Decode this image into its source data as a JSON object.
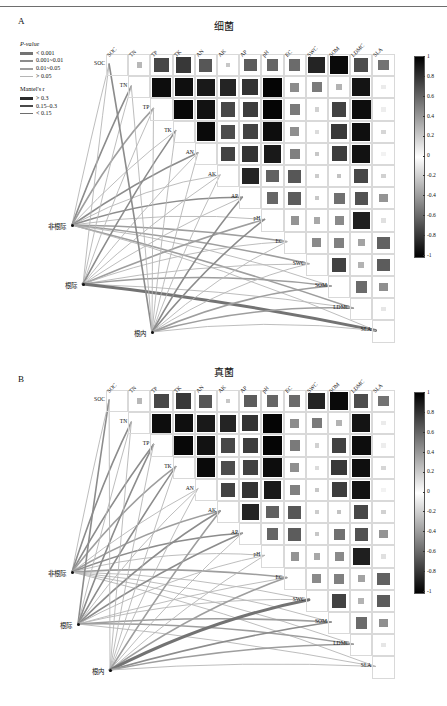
{
  "figure": {
    "panels": [
      {
        "letter": "A",
        "title": "细菌"
      },
      {
        "letter": "B",
        "title": "真菌"
      }
    ]
  },
  "legend": {
    "pvalue": {
      "title": "P-value",
      "items": [
        {
          "label": "< 0.001",
          "width": 3.0,
          "color": "#737373"
        },
        {
          "label": "0.001~0.01",
          "width": 2.2,
          "color": "#8c8c8c"
        },
        {
          "label": "0.01~0.05",
          "width": 2.2,
          "color": "#9e9e9e"
        },
        {
          "label": "> 0.05",
          "width": 1.4,
          "color": "#b5b5b5"
        }
      ]
    },
    "mantel": {
      "title": "Mantel's r",
      "items": [
        {
          "label": "> 0.3",
          "width": 3.0,
          "color": "#2b2b2b"
        },
        {
          "label": "0.15–0.3",
          "width": 1.6,
          "color": "#4a4a4a"
        },
        {
          "label": "< 0.15",
          "width": 0.9,
          "color": "#6e6e6e"
        }
      ]
    }
  },
  "colorbar": {
    "ticks": [
      "1",
      "0.8",
      "0.6",
      "0.4",
      "0.2",
      "0",
      "-0.2",
      "-0.4",
      "-0.6",
      "-0.8",
      "-1"
    ],
    "max": 1,
    "min": -1,
    "high_color": "#000000",
    "mid_color": "#ffffff",
    "low_color": "#000000"
  },
  "network": {
    "nodes": [
      {
        "id": "non_rhizosphere",
        "label": "非根际"
      },
      {
        "id": "rhizosphere",
        "label": "根际"
      },
      {
        "id": "endosphere",
        "label": "根内"
      }
    ]
  },
  "chart_data": {
    "type": "heatmap",
    "variables": [
      "SOC",
      "TN",
      "TP",
      "TK",
      "AN",
      "AK",
      "AP",
      "pH",
      "EC",
      "SWC",
      "SOM",
      "LDMC",
      "SLA"
    ],
    "xlabel": "",
    "ylabel": "",
    "zlim": [
      -1,
      1
    ],
    "legend_position": "right",
    "grid": true,
    "panels": [
      {
        "letter": "A",
        "title": "细菌",
        "matrix": [
          [
            1.0,
            0.28,
            0.72,
            0.78,
            0.66,
            0.22,
            0.64,
            0.6,
            0.58,
            0.86,
            0.96,
            0.7,
            0.55
          ],
          [
            null,
            1.0,
            0.95,
            0.94,
            0.9,
            0.86,
            0.8,
            0.98,
            0.45,
            0.52,
            0.3,
            0.92,
            0.08
          ],
          [
            null,
            null,
            1.0,
            0.97,
            0.93,
            0.72,
            0.76,
            0.98,
            0.52,
            0.18,
            0.74,
            0.95,
            0.07
          ],
          [
            null,
            null,
            null,
            1.0,
            0.96,
            0.7,
            0.74,
            0.95,
            0.44,
            0.14,
            0.78,
            0.94,
            0.16
          ],
          [
            null,
            null,
            null,
            null,
            1.0,
            0.74,
            0.8,
            0.9,
            0.5,
            0.22,
            0.76,
            0.93,
            0.05
          ],
          [
            null,
            null,
            null,
            null,
            null,
            1.0,
            0.86,
            0.62,
            0.66,
            0.2,
            0.24,
            0.72,
            0.18
          ],
          [
            null,
            null,
            null,
            null,
            null,
            null,
            1.0,
            0.6,
            0.64,
            0.22,
            0.56,
            0.68,
            0.42
          ],
          [
            null,
            null,
            null,
            null,
            null,
            null,
            null,
            1.0,
            0.42,
            0.34,
            0.46,
            0.88,
            0.12
          ],
          [
            null,
            null,
            null,
            null,
            null,
            null,
            null,
            null,
            1.0,
            0.46,
            0.5,
            0.36,
            0.62
          ],
          [
            null,
            null,
            null,
            null,
            null,
            null,
            null,
            null,
            null,
            1.0,
            0.74,
            0.3,
            0.64
          ],
          [
            null,
            null,
            null,
            null,
            null,
            null,
            null,
            null,
            null,
            null,
            1.0,
            0.58,
            0.44
          ],
          [
            null,
            null,
            null,
            null,
            null,
            null,
            null,
            null,
            null,
            null,
            null,
            1.0,
            0.1
          ],
          [
            null,
            null,
            null,
            null,
            null,
            null,
            null,
            null,
            null,
            null,
            null,
            null,
            1.0
          ]
        ]
      },
      {
        "letter": "B",
        "title": "真菌",
        "matrix": [
          [
            1.0,
            0.28,
            0.72,
            0.78,
            0.66,
            0.22,
            0.64,
            0.6,
            0.58,
            0.86,
            0.96,
            0.7,
            0.55
          ],
          [
            null,
            1.0,
            0.95,
            0.94,
            0.9,
            0.86,
            0.8,
            0.98,
            0.45,
            0.52,
            0.3,
            0.92,
            0.08
          ],
          [
            null,
            null,
            1.0,
            0.97,
            0.93,
            0.72,
            0.76,
            0.98,
            0.52,
            0.18,
            0.74,
            0.95,
            0.07
          ],
          [
            null,
            null,
            null,
            1.0,
            0.96,
            0.7,
            0.74,
            0.95,
            0.44,
            0.14,
            0.78,
            0.94,
            0.16
          ],
          [
            null,
            null,
            null,
            null,
            1.0,
            0.74,
            0.8,
            0.9,
            0.5,
            0.22,
            0.76,
            0.93,
            0.05
          ],
          [
            null,
            null,
            null,
            null,
            null,
            1.0,
            0.86,
            0.62,
            0.66,
            0.2,
            0.24,
            0.72,
            0.18
          ],
          [
            null,
            null,
            null,
            null,
            null,
            null,
            1.0,
            0.6,
            0.64,
            0.22,
            0.56,
            0.68,
            0.42
          ],
          [
            null,
            null,
            null,
            null,
            null,
            null,
            null,
            1.0,
            0.42,
            0.34,
            0.46,
            0.88,
            0.12
          ],
          [
            null,
            null,
            null,
            null,
            null,
            null,
            null,
            null,
            1.0,
            0.46,
            0.5,
            0.36,
            0.62
          ],
          [
            null,
            null,
            null,
            null,
            null,
            null,
            null,
            null,
            null,
            1.0,
            0.74,
            0.3,
            0.64
          ],
          [
            null,
            null,
            null,
            null,
            null,
            null,
            null,
            null,
            null,
            null,
            1.0,
            0.58,
            0.44
          ],
          [
            null,
            null,
            null,
            null,
            null,
            null,
            null,
            null,
            null,
            null,
            null,
            1.0,
            0.1
          ],
          [
            null,
            null,
            null,
            null,
            null,
            null,
            null,
            null,
            null,
            null,
            null,
            null,
            1.0
          ]
        ]
      }
    ]
  }
}
